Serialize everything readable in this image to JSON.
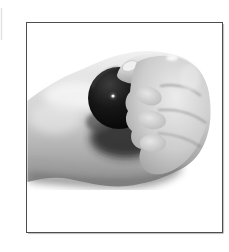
{
  "page": {
    "background": "#ffffff"
  },
  "figure": {
    "alt": "Black-and-white photograph of a hand holding a small black ball in its curled fingers, inside a thin dark rectangular frame",
    "style": "black-and-white photograph",
    "colors": {
      "frame_border": "#4d4d4d",
      "frame_shadow": "#bdbdbd",
      "photo_background": "#ffffff",
      "ball": "#0a0a0a",
      "ball_rim": "#3c3c3c",
      "ball_dot": "#f8f8f8",
      "skin_light": "#f4f4f4",
      "skin_mid": "#c6c6c6",
      "skin_shadow": "#6e6e6e",
      "crevice_shadow": "#242424",
      "nail": "#f0f0f0",
      "artifact_line": "#e2e2e2"
    }
  }
}
